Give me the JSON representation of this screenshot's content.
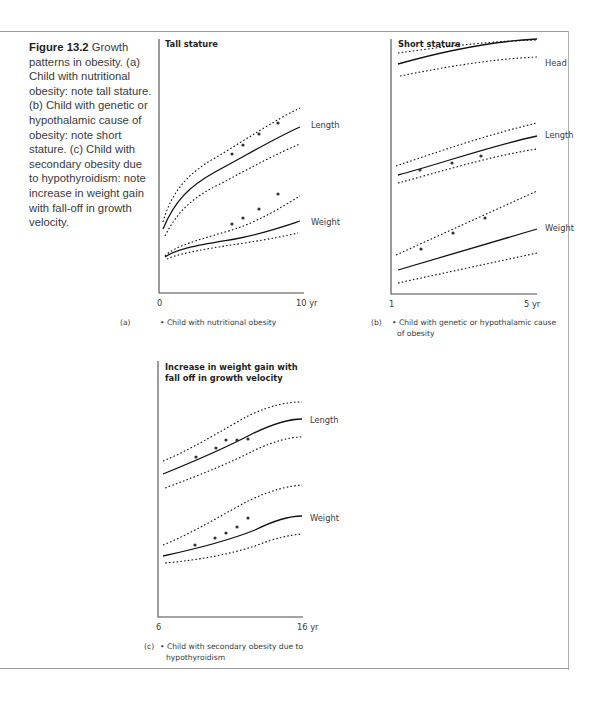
{
  "caption": {
    "figure_label": "Figure 13.2",
    "text": " Growth patterns in obesity. (a) Child with nutritional obesity: note tall stature. (b) Child with genetic or hypothalamic cause of obesity: note short stature. (c) Child with secondary obesity due to hypothyroidism: note increase in weight gain with fall-off in growth velocity."
  },
  "panels": [
    {
      "id": "a",
      "title": [
        "Tall stature"
      ],
      "panel_label": "(a)",
      "x_start": "0",
      "x_end": "10 yr",
      "legend": [
        "• Child with nutritional obesity"
      ],
      "curve_labels": [
        "Length",
        "Weight"
      ]
    },
    {
      "id": "b",
      "title": [
        "Short stature"
      ],
      "panel_label": "(b)",
      "x_start": "1",
      "x_end": "5 yr",
      "legend": [
        "• Child with genetic or hypothalamic cause",
        "of obesity"
      ],
      "curve_labels": [
        "Head",
        "Length",
        "Weight"
      ]
    },
    {
      "id": "c",
      "title": [
        "Increase in weight gain with",
        "fall off in growth velocity"
      ],
      "panel_label": "(c)",
      "x_start": "6",
      "x_end": "16 yr",
      "legend": [
        "• Child with secondary obesity due to",
        "hypothyroidism"
      ],
      "curve_labels": [
        "Length",
        "Weight"
      ]
    }
  ],
  "chart_data": [
    {
      "type": "line",
      "title": "Tall stature",
      "xlabel": "Age",
      "x_range": [
        0,
        10
      ],
      "x_unit": "yr",
      "series": [
        {
          "name": "Length",
          "pattern": "centile band (upper/median/lower), observations near upper centile",
          "points_count": 4
        },
        {
          "name": "Weight",
          "pattern": "centile band, observations above upper centile",
          "points_count": 4
        }
      ],
      "legend": "Child with nutritional obesity"
    },
    {
      "type": "line",
      "title": "Short stature",
      "xlabel": "Age",
      "x_range": [
        1,
        5
      ],
      "x_unit": "yr",
      "series": [
        {
          "name": "Head",
          "pattern": "centile band, no observations",
          "points_count": 0
        },
        {
          "name": "Length",
          "pattern": "centile band, observations on lower centile",
          "points_count": 3
        },
        {
          "name": "Weight",
          "pattern": "centile band, observations on/above upper centile",
          "points_count": 3
        }
      ],
      "legend": "Child with genetic or hypothalamic cause of obesity"
    },
    {
      "type": "line",
      "title": "Increase in weight gain with fall off in growth velocity",
      "xlabel": "Age",
      "x_range": [
        6,
        16
      ],
      "x_unit": "yr",
      "series": [
        {
          "name": "Length",
          "pattern": "centile band, observations flatten (fall-off) crossing median",
          "points_count": 5
        },
        {
          "name": "Weight",
          "pattern": "centile band, observations rising above median",
          "points_count": 5
        }
      ],
      "legend": "Child with secondary obesity due to hypothyroidism"
    }
  ]
}
